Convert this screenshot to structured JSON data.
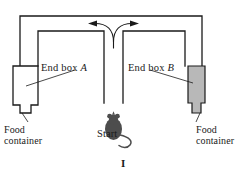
{
  "figure": {
    "caption": "I",
    "type": "T-maze apparatus diagram"
  },
  "labels": {
    "end_box_a_prefix": "End box ",
    "end_box_a_letter": "A",
    "end_box_b_prefix": "End box ",
    "end_box_b_letter": "B",
    "food_container_left_line1": "Food",
    "food_container_left_line2": "container",
    "food_container_right_line1": "Food",
    "food_container_right_line2": "container",
    "start": "Start"
  },
  "colors": {
    "line": "#1a1a1a",
    "background": "#ffffff",
    "end_box_b_fill": "#b8b8b8",
    "mouse_fill": "#4d4d4d",
    "end_box_a_fill": "#ffffff"
  },
  "elements": {
    "arrow_left_direction": "left",
    "arrow_right_direction": "right",
    "mouse_position": "start",
    "mouse_facing": "up"
  }
}
